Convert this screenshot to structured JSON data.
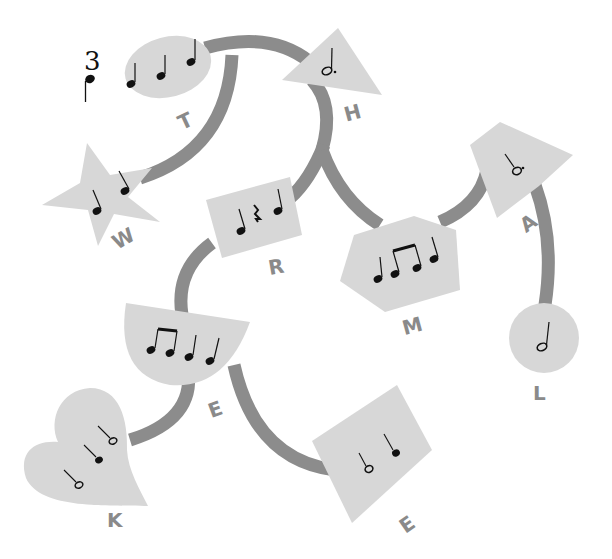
{
  "time_signature": {
    "top": "3",
    "bottom_note": "quarter"
  },
  "colors": {
    "path": "#8c8c8c",
    "shape_fill": "#d7d7d7",
    "label": "#8a8a8a",
    "note": "#111111",
    "background": "#ffffff"
  },
  "nodes": [
    {
      "id": "T",
      "label": "T",
      "shape": "ellipse",
      "rhythm": [
        "quarter",
        "quarter",
        "quarter"
      ]
    },
    {
      "id": "H",
      "label": "H",
      "shape": "triangle",
      "rhythm": [
        "dotted-half"
      ]
    },
    {
      "id": "W",
      "label": "W",
      "shape": "star",
      "rhythm": [
        "quarter",
        "quarter"
      ]
    },
    {
      "id": "R",
      "label": "R",
      "shape": "rectangle",
      "rhythm": [
        "quarter",
        "quarter-rest",
        "quarter"
      ]
    },
    {
      "id": "M",
      "label": "M",
      "shape": "hexagon",
      "rhythm": [
        "quarter",
        "eighth-pair",
        "quarter"
      ]
    },
    {
      "id": "A",
      "label": "A",
      "shape": "quadrilateral",
      "rhythm": [
        "dotted-half"
      ]
    },
    {
      "id": "L",
      "label": "L",
      "shape": "circle",
      "rhythm": [
        "half"
      ]
    },
    {
      "id": "E1",
      "label": "E",
      "shape": "half-circle",
      "rhythm": [
        "eighth-pair",
        "quarter",
        "quarter"
      ]
    },
    {
      "id": "K",
      "label": "K",
      "shape": "heart",
      "rhythm": [
        "half",
        "quarter",
        "half"
      ]
    },
    {
      "id": "E2",
      "label": "E",
      "shape": "diamond",
      "rhythm": [
        "half",
        "quarter"
      ]
    }
  ],
  "edges": [
    [
      "T",
      "H"
    ],
    [
      "T",
      "W"
    ],
    [
      "H",
      "R"
    ],
    [
      "H",
      "M"
    ],
    [
      "M",
      "A"
    ],
    [
      "A",
      "L"
    ],
    [
      "R",
      "E1"
    ],
    [
      "E1",
      "K"
    ],
    [
      "E1",
      "E2"
    ]
  ]
}
